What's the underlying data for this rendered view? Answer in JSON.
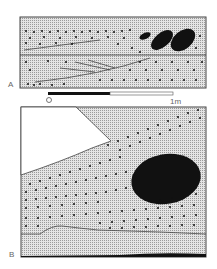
{
  "figure": {
    "panels": [
      {
        "id": "A",
        "label": "A"
      },
      {
        "id": "B",
        "label": "B"
      }
    ],
    "scale_bar": {
      "start_label": "0",
      "end_label": "1m"
    }
  }
}
